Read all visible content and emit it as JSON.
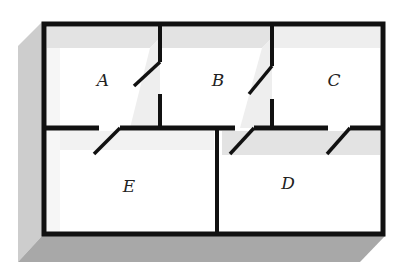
{
  "diagram": {
    "type": "floor-plan",
    "colors": {
      "wall": "#111111",
      "floor": "#ffffff",
      "shade_light": "#e2e2e2",
      "shade_side": "#cfcfcf",
      "shade_bottom": "#a9a9a9"
    },
    "rooms": [
      {
        "id": "A",
        "label": "A",
        "x": 103,
        "y": 86
      },
      {
        "id": "B",
        "label": "B",
        "x": 218,
        "y": 86
      },
      {
        "id": "C",
        "label": "C",
        "x": 334,
        "y": 86
      },
      {
        "id": "E",
        "label": "E",
        "x": 129,
        "y": 192
      },
      {
        "id": "D",
        "label": "D",
        "x": 288,
        "y": 189
      }
    ],
    "doors": [
      {
        "between": "A-B"
      },
      {
        "between": "B-C"
      },
      {
        "between": "A-E"
      },
      {
        "between": "B-D"
      },
      {
        "between": "C-D"
      }
    ]
  }
}
